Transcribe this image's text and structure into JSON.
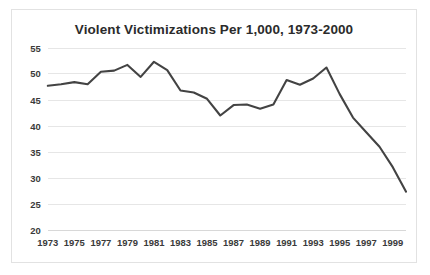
{
  "chart": {
    "title": "Violent Victimizations Per 1,000, 1973-2000",
    "frame_border_color": "#e2e2e2",
    "background_color": "#ffffff"
  },
  "chart_data": {
    "type": "line",
    "title": "Violent Victimizations Per 1,000, 1973-2000",
    "xlabel": "",
    "ylabel": "",
    "xlim": [
      1973,
      2000
    ],
    "ylim": [
      20,
      55
    ],
    "ytick_step": 5,
    "grid": true,
    "legend": null,
    "legend_position": "none",
    "line_color": "#434343",
    "grid_color": "#e6e6e6",
    "yticks": [
      20,
      25,
      30,
      35,
      40,
      45,
      50,
      55
    ],
    "xticks": [
      1973,
      1975,
      1977,
      1979,
      1981,
      1983,
      1985,
      1987,
      1989,
      1991,
      1993,
      1995,
      1997,
      1999
    ],
    "x": [
      1973,
      1974,
      1975,
      1976,
      1977,
      1978,
      1979,
      1980,
      1981,
      1982,
      1983,
      1984,
      1985,
      1986,
      1987,
      1988,
      1989,
      1990,
      1991,
      1992,
      1993,
      1994,
      1995,
      1996,
      1997,
      1998,
      1999,
      2000
    ],
    "values": [
      47.7,
      48.0,
      48.4,
      48.0,
      50.4,
      50.6,
      51.7,
      49.4,
      52.3,
      50.7,
      46.8,
      46.4,
      45.2,
      42.0,
      44.0,
      44.1,
      43.3,
      44.1,
      48.8,
      47.9,
      49.1,
      51.2,
      46.1,
      41.6,
      38.8,
      36.0,
      32.1,
      27.4
    ]
  }
}
